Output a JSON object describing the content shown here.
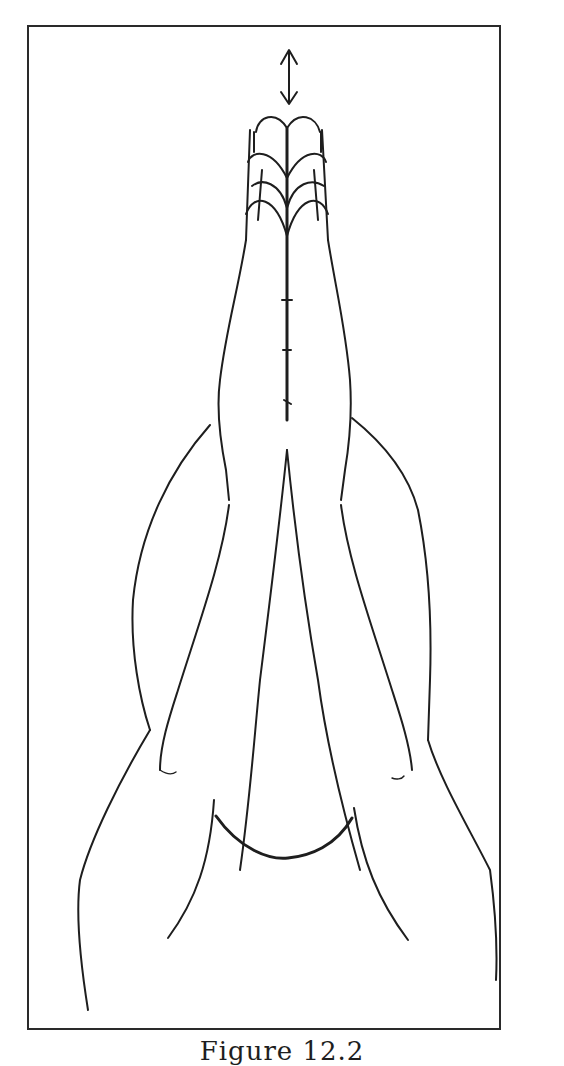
{
  "figure": {
    "caption": "Figure 12.2",
    "caption_visibility": "partially cropped at bottom edge",
    "annotations": [
      {
        "type": "double-headed-arrow",
        "orientation": "vertical",
        "position": "above fingertips"
      }
    ],
    "colors": {
      "line": "#1e1e1e",
      "background": "#ffffff",
      "frame": "#2a2a2a"
    }
  }
}
